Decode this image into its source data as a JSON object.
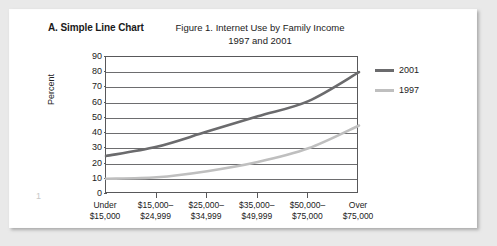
{
  "panel": {
    "label": "A. Simple Line Chart",
    "page_number": "1"
  },
  "figure": {
    "title_line1": "Figure 1. Internet Use by Family Income",
    "title_line2": "1997 and 2001"
  },
  "colors": {
    "series_2001": "#6b6b6d",
    "series_1997": "#bfbfbf",
    "axis": "#58585a",
    "grid": "#6d6d6f",
    "card_background": "#ffffff",
    "page_background": "#e9e9e9"
  },
  "chart_data": {
    "type": "line",
    "title": "Figure 1. Internet Use by Family Income 1997 and 2001",
    "xlabel": "",
    "ylabel": "Percent",
    "ylim": [
      0,
      90
    ],
    "yticks": [
      0,
      10,
      20,
      30,
      40,
      50,
      60,
      70,
      80,
      90
    ],
    "grid": true,
    "legend_position": "right",
    "categories": [
      "Under $15,000",
      "$15,000-$24,999",
      "$25,000-$34,999",
      "$35,000-$49,999",
      "$50,000-$75,000",
      "Over $75,000"
    ],
    "category_labels": [
      {
        "line1": "Under",
        "line2": "$15,000"
      },
      {
        "line1": "$15,000–",
        "line2": "$24,999"
      },
      {
        "line1": "$25,000–",
        "line2": "$34,999"
      },
      {
        "line1": "$35,000–",
        "line2": "$49,999"
      },
      {
        "line1": "$50,000–",
        "line2": "$75,000"
      },
      {
        "line1": "Over",
        "line2": "$75,000"
      }
    ],
    "series": [
      {
        "name": "2001",
        "color": "#6b6b6d",
        "values": [
          25,
          31,
          41,
          51,
          61,
          80
        ]
      },
      {
        "name": "1997",
        "color": "#bfbfbf",
        "values": [
          10,
          11,
          15,
          21,
          30,
          45
        ]
      }
    ]
  },
  "legend": {
    "items": [
      {
        "label": "2001"
      },
      {
        "label": "1997"
      }
    ]
  }
}
